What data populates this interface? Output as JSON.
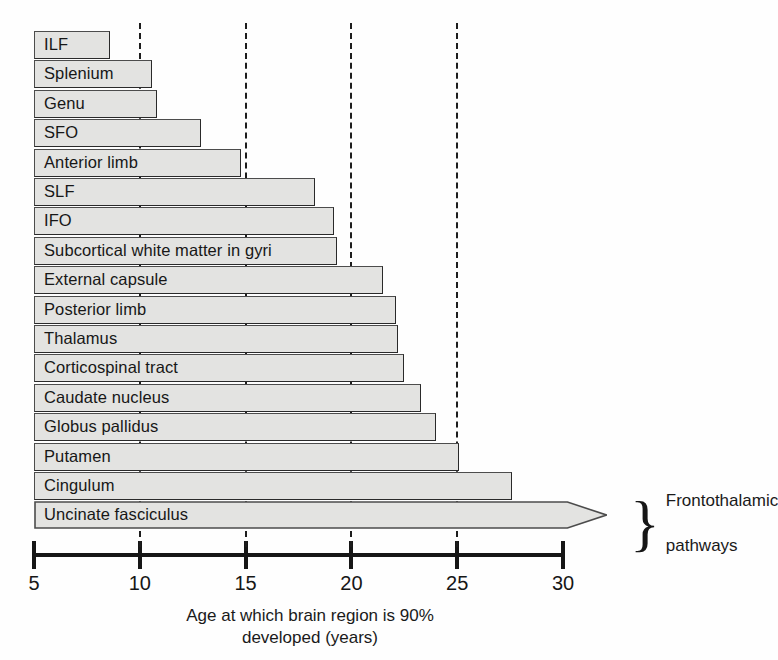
{
  "chart_data": {
    "type": "bar",
    "orientation": "horizontal",
    "title": "",
    "xlabel": "Age at which brain region is 90%\ndeveloped (years)",
    "ylabel": "",
    "xlim": [
      5,
      30
    ],
    "xticks": [
      5,
      10,
      15,
      20,
      25,
      30
    ],
    "xticklabels": [
      "5",
      "10",
      "15",
      "20",
      "25",
      "30"
    ],
    "grid": "vertical dashed gridlines at 10, 15, 20, 25",
    "gridlines": [
      10,
      15,
      20,
      25
    ],
    "legend": "none",
    "bar_baseline": 5,
    "categories": [
      "ILF",
      "Splenium",
      "Genu",
      "SFO",
      "Anterior limb",
      "SLF",
      "IFO",
      "Subcortical white matter in gyri",
      "External capsule",
      "Posterior limb",
      "Thalamus",
      "Corticospinal tract",
      "Caudate nucleus",
      "Globus pallidus",
      "Putamen",
      "Cingulum",
      "Uncinate fasciculus"
    ],
    "values": [
      8.6,
      10.6,
      10.8,
      12.9,
      14.8,
      18.3,
      19.2,
      19.3,
      21.5,
      22.1,
      22.2,
      22.5,
      23.3,
      24.0,
      25.1,
      27.6,
      32.1
    ],
    "value_note": "Bar lengths read off the age axis; the final bar (Uncinate fasciculus) is drawn as an open arrow extending beyond the axis end.",
    "arrow_bars": [
      "Uncinate fasciculus"
    ],
    "annotations": [
      {
        "text": "Frontothalamic\npathways",
        "brace": "}",
        "applies_to": [
          "Cingulum",
          "Uncinate fasciculus"
        ]
      }
    ],
    "colors": {
      "bar_fill": "#e3e3e1",
      "bar_stroke": "#4c4c4c",
      "axis": "#161616",
      "gridline": "#1d1d1d",
      "text": "#1a1a1a",
      "background": "#ffffff"
    }
  },
  "axis": {
    "caption_line1": "Age at which brain region is 90%",
    "caption_line2": "developed (years)"
  },
  "annotation": {
    "brace": "}",
    "line1": "Frontothalamic",
    "line2": "pathways"
  }
}
